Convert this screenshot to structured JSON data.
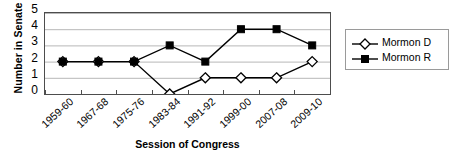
{
  "chart_data": {
    "type": "line",
    "title": "",
    "xlabel": "Session of Congress",
    "ylabel": "Number in Senate",
    "categories": [
      "1959-60",
      "1967-68",
      "1975-76",
      "1983-84",
      "1991-92",
      "1999-00",
      "2007-08",
      "2009-10"
    ],
    "series": [
      {
        "name": "Mormon D",
        "marker": "open-diamond",
        "color": "#000000",
        "values": [
          2,
          2,
          2,
          0,
          1,
          1,
          1,
          2
        ]
      },
      {
        "name": "Mormon R",
        "marker": "filled-square",
        "color": "#000000",
        "values": [
          2,
          2,
          2,
          3,
          2,
          4,
          4,
          3
        ]
      }
    ],
    "ylim": [
      0,
      5
    ],
    "yticks": [
      0,
      1,
      2,
      3,
      4,
      5
    ],
    "grid": "horizontal",
    "legend_position": "right"
  }
}
